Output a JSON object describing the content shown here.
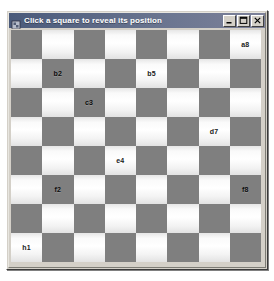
{
  "window": {
    "title": "Click a square to reveal its position",
    "icon": "app-icon",
    "controls": [
      {
        "name": "minimize-button",
        "glyph": "minimize-icon",
        "label": "Minimize"
      },
      {
        "name": "maximize-button",
        "glyph": "maximize-icon",
        "label": "Maximize"
      },
      {
        "name": "close-button",
        "glyph": "close-icon",
        "label": "Close"
      }
    ]
  },
  "board": {
    "rows": 8,
    "columns": 8,
    "top_left_square_color": "dark",
    "colors": {
      "dark_square": "#7f7f7f",
      "light_square": "#ffffff",
      "label_text": "#1a1a1a",
      "title_bar": "#6a7590",
      "window_face": "#d4d0c8"
    },
    "revealed_labels": [
      {
        "row": 0,
        "col": 7,
        "text": "a8",
        "square": "light"
      },
      {
        "row": 1,
        "col": 1,
        "text": "b2",
        "square": "dark"
      },
      {
        "row": 1,
        "col": 4,
        "text": "b5",
        "square": "light"
      },
      {
        "row": 2,
        "col": 2,
        "text": "c3",
        "square": "dark"
      },
      {
        "row": 3,
        "col": 6,
        "text": "d7",
        "square": "light"
      },
      {
        "row": 4,
        "col": 3,
        "text": "e4",
        "square": "dark"
      },
      {
        "row": 5,
        "col": 1,
        "text": "f2",
        "square": "dark"
      },
      {
        "row": 5,
        "col": 7,
        "text": "f8",
        "square": "dark"
      },
      {
        "row": 7,
        "col": 0,
        "text": "h1",
        "square": "light"
      }
    ]
  }
}
